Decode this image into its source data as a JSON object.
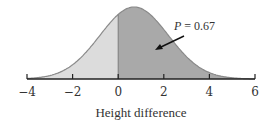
{
  "chart_data": {
    "type": "area",
    "title": "",
    "xlabel": "Height difference",
    "ylabel": "",
    "xlim": [
      -4,
      6
    ],
    "x_ticks": [
      -4,
      -2,
      0,
      2,
      4,
      6
    ],
    "x_tick_labels": [
      "−4",
      "−2",
      "0",
      "2",
      "4",
      "6"
    ],
    "distribution": {
      "family": "normal",
      "mean": 0.7,
      "sd": 1.5
    },
    "shaded_regions": [
      {
        "name": "below zero",
        "from": -4,
        "to": 0,
        "color": "#dcdcdc"
      },
      {
        "name": "above zero",
        "from": 0,
        "to": 6,
        "color": "#a9a9a9",
        "probability": 0.67
      }
    ],
    "annotations": [
      {
        "text_var": "P",
        "text_value": "= 0.67",
        "arrow_to": [
          1.6,
          0.15
        ]
      }
    ],
    "grid": false,
    "legend": null
  },
  "labels": {
    "xlabel": "Height difference",
    "annot_var": "P",
    "annot_value": " = 0.67",
    "ticks": [
      "−4",
      "−2",
      "0",
      "2",
      "4",
      "6"
    ]
  },
  "colors": {
    "light_fill": "#dcdcdc",
    "dark_fill": "#a9a9a9",
    "curve": "#8a8a8a",
    "axis": "#222222"
  }
}
